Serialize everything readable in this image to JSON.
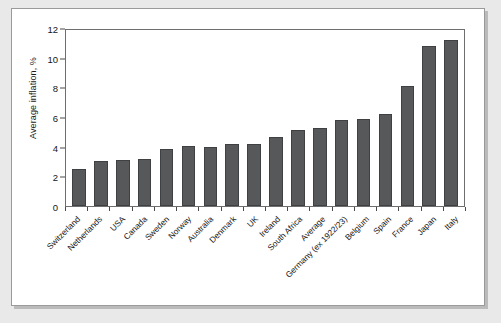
{
  "chart_data": {
    "type": "bar",
    "title": "",
    "subtitle": "",
    "xlabel": "",
    "ylabel": "Average inflation, %",
    "ylim": [
      0,
      12
    ],
    "yticks": [
      0,
      2,
      4,
      6,
      8,
      10,
      12
    ],
    "grid": false,
    "legend": null,
    "bar_color": "#57585a",
    "categories": [
      "Switzerland",
      "Netherlands",
      "USA",
      "Canada",
      "Sweden",
      "Norway",
      "Australia",
      "Denmark",
      "UK",
      "Ireland",
      "South Africa",
      "Average",
      "Germany (ex 1922/23)",
      "Belgium",
      "Spain",
      "France",
      "Japan",
      "Italy"
    ],
    "values": [
      2.5,
      3.1,
      3.15,
      3.2,
      3.9,
      4.1,
      4.05,
      4.2,
      4.25,
      4.7,
      5.15,
      5.35,
      5.85,
      5.9,
      6.25,
      8.15,
      10.9,
      11.3
    ]
  },
  "figure": {
    "background_color": "#e9e9e9",
    "card_color": "#ffffff",
    "frame_color": "#9a9a9a",
    "axis_color": "#6e6e6e"
  }
}
